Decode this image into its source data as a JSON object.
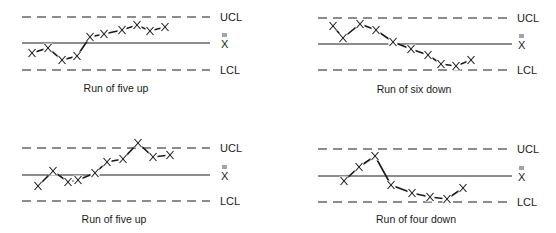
{
  "labels": {
    "ucl": "UCL",
    "center": "X",
    "lcl": "LCL"
  },
  "colors": {
    "ink": "#1a1a1a",
    "background": "#ffffff"
  },
  "chart_data": [
    {
      "type": "line",
      "title": "Run of five up",
      "position": "top-left",
      "limits": {
        "ucl": "UCL",
        "center": "X̿",
        "lcl": "LCL"
      },
      "limit_px": {
        "ucl": 17,
        "center": 43,
        "lcl": 70,
        "x_start": 22,
        "x_end": 210,
        "label_x": 220
      },
      "x": [
        32,
        48,
        62,
        77,
        90,
        104,
        122,
        137,
        150,
        165
      ],
      "y": [
        53,
        48,
        60,
        56,
        37,
        34,
        30,
        25,
        31,
        27
      ],
      "caption_x": 116,
      "caption_y": 92
    },
    {
      "type": "line",
      "title": "Run of six down",
      "position": "top-right",
      "limits": {
        "ucl": "UCL",
        "center": "X̿",
        "lcl": "LCL"
      },
      "limit_px": {
        "ucl": 18,
        "center": 44,
        "lcl": 70,
        "x_start": 318,
        "x_end": 512,
        "label_x": 517
      },
      "x": [
        333,
        343,
        360,
        376,
        393,
        411,
        428,
        441,
        456,
        471
      ],
      "y": [
        26,
        38,
        24,
        30,
        42,
        49,
        55,
        64,
        66,
        60
      ],
      "caption_x": 414,
      "caption_y": 93
    },
    {
      "type": "line",
      "title": "Run of five up",
      "position": "bottom-left",
      "limits": {
        "ucl": "UCL",
        "center": "X̿",
        "lcl": "LCL"
      },
      "limit_px": {
        "ucl": 148,
        "center": 175,
        "lcl": 201,
        "x_start": 22,
        "x_end": 210,
        "label_x": 220
      },
      "x": [
        38,
        53,
        68,
        78,
        95,
        107,
        123,
        138,
        153,
        170
      ],
      "y": [
        186,
        171,
        182,
        180,
        173,
        162,
        159,
        143,
        157,
        155
      ],
      "caption_x": 114,
      "caption_y": 223
    },
    {
      "type": "line",
      "title": "Run of four down",
      "position": "bottom-right",
      "limits": {
        "ucl": "UCL",
        "center": "X̿",
        "lcl": "LCL"
      },
      "limit_px": {
        "ucl": 149,
        "center": 176,
        "lcl": 202,
        "x_start": 318,
        "x_end": 512,
        "label_x": 517
      },
      "x": [
        344,
        359,
        375,
        391,
        412,
        430,
        447,
        463
      ],
      "y": [
        181,
        167,
        156,
        185,
        193,
        197,
        199,
        188
      ],
      "caption_x": 416,
      "caption_y": 223
    }
  ]
}
